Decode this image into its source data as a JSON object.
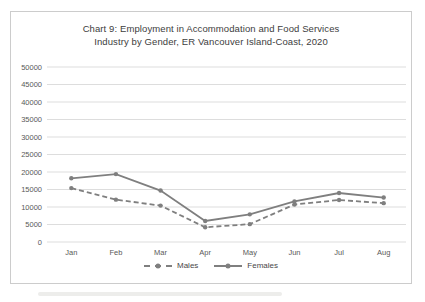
{
  "chart_data": {
    "type": "line",
    "title": "Chart 9: Employment in Accommodation and Food Services Industry by Gender, ER Vancouver Island-Coast, 2020",
    "title_lines": [
      "Chart 9: Employment in Accommodation and Food Services",
      "Industry by Gender, ER Vancouver Island-Coast, 2020"
    ],
    "categories": [
      "Jan",
      "Feb",
      "Mar",
      "Apr",
      "May",
      "Jun",
      "Jul",
      "Aug"
    ],
    "series": [
      {
        "name": "Males",
        "style": "dashed",
        "color": "#7f7f7f",
        "marker": "circle",
        "values": [
          15400,
          12100,
          10400,
          4200,
          5100,
          10700,
          12000,
          11100
        ]
      },
      {
        "name": "Females",
        "style": "solid",
        "color": "#7f7f7f",
        "marker": "circle",
        "values": [
          18200,
          19400,
          14700,
          6000,
          7900,
          11600,
          14000,
          12700
        ]
      }
    ],
    "ylim": [
      0,
      50000
    ],
    "ytick_step": 5000,
    "ytick_labels": [
      "0",
      "5000",
      "10000",
      "15000",
      "20000",
      "25000",
      "30000",
      "35000",
      "40000",
      "45000",
      "50000"
    ],
    "xlabel": "",
    "ylabel": "",
    "grid": "horizontal",
    "legend_position": "bottom",
    "colors": {
      "gridline": "#d9d9d9",
      "axis_text": "#595959",
      "title_text": "#3d3d3d",
      "frame_border": "#cccccc"
    }
  }
}
